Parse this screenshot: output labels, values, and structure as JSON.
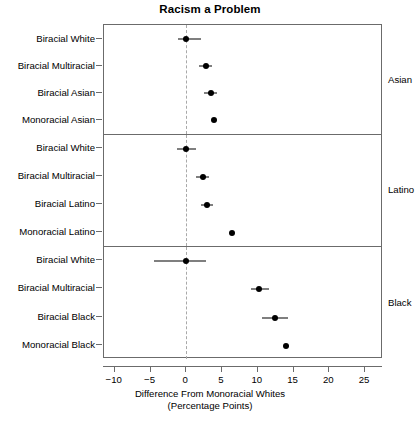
{
  "chart_data": {
    "type": "scatter",
    "title": "Racism a Problem",
    "xlabel_line1": "Difference From Monoracial Whites",
    "xlabel_line2": "(Percentage Points)",
    "ylabel": "",
    "xlim": [
      -11.5,
      27.5
    ],
    "xticks": [
      -10,
      -5,
      0,
      5,
      10,
      15,
      20,
      25
    ],
    "xticklabels": [
      "−10",
      "−5",
      "0",
      "5",
      "10",
      "15",
      "20",
      "25"
    ],
    "grid": false,
    "legend": "none",
    "reference_line": {
      "x": 0,
      "style": "dashed",
      "color": "#a9a9a9"
    },
    "marker_color": "#000000",
    "errorbar_color": "#000000",
    "strip_position": "right",
    "panels": [
      {
        "strip_label": "Asian",
        "points": [
          {
            "label": "Biracial White",
            "value": 0.0,
            "ci_low": -1.1,
            "ci_high": 2.1
          },
          {
            "label": "Biracial Multiracial",
            "value": 2.7,
            "ci_low": 1.8,
            "ci_high": 3.6
          },
          {
            "label": "Biracial Asian",
            "value": 3.4,
            "ci_low": 2.5,
            "ci_high": 4.3
          },
          {
            "label": "Monoracial Asian",
            "value": 3.9,
            "ci_low": 3.6,
            "ci_high": 4.2
          }
        ]
      },
      {
        "strip_label": "Latino",
        "points": [
          {
            "label": "Biracial White",
            "value": 0.0,
            "ci_low": -1.3,
            "ci_high": 1.3
          },
          {
            "label": "Biracial Multiracial",
            "value": 2.3,
            "ci_low": 1.4,
            "ci_high": 3.2
          },
          {
            "label": "Biracial Latino",
            "value": 2.9,
            "ci_low": 2.0,
            "ci_high": 3.8
          },
          {
            "label": "Monoracial Latino",
            "value": 6.4,
            "ci_low": 6.1,
            "ci_high": 6.7
          }
        ]
      },
      {
        "strip_label": "Black",
        "points": [
          {
            "label": "Biracial White",
            "value": 0.0,
            "ci_low": -4.5,
            "ci_high": 2.8
          },
          {
            "label": "Biracial Multiracial",
            "value": 10.2,
            "ci_low": 9.0,
            "ci_high": 11.6
          },
          {
            "label": "Biracial Black",
            "value": 12.4,
            "ci_low": 10.6,
            "ci_high": 14.2
          },
          {
            "label": "Monoracial Black",
            "value": 14.0,
            "ci_low": 13.8,
            "ci_high": 14.3
          }
        ]
      }
    ]
  }
}
